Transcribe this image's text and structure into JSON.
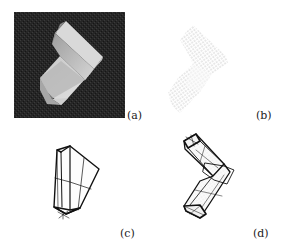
{
  "figure": {
    "panels": [
      {
        "id": "a",
        "label": "(a)",
        "content": "grayscale photograph of L-shaped (chevron) block on dark textured background"
      },
      {
        "id": "b",
        "label": "(b)",
        "content": "dotted point cloud of L-shaped block"
      },
      {
        "id": "c",
        "label": "(c)",
        "content": "single wireframe tapered box model"
      },
      {
        "id": "d",
        "label": "(d)",
        "content": "two-part wireframe model of L-shaped block"
      }
    ]
  }
}
